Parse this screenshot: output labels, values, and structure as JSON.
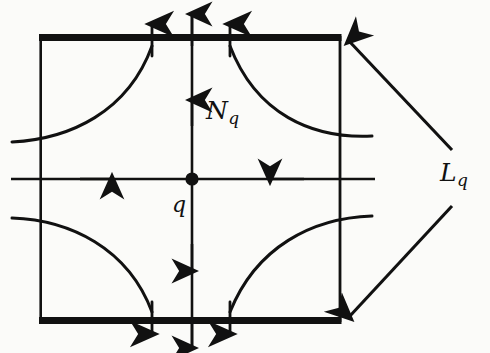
{
  "figure": {
    "background_color": "#fbfbf9",
    "ink_color": "#111111",
    "labels": {
      "unstable_manifold": {
        "base": "N",
        "subscript": "q"
      },
      "stable_manifold": {
        "base": "L",
        "subscript": "q"
      },
      "fixed_point": {
        "base": "q",
        "subscript": ""
      }
    },
    "square": {
      "left": 42,
      "top": 35,
      "right": 340,
      "bottom": 323,
      "bold_edges": [
        "top",
        "bottom"
      ],
      "thin_edges": [
        "left",
        "right"
      ],
      "bold_edge_width": 7,
      "thin_edge_width": 2.6
    },
    "fixed_point": {
      "x": 192,
      "y": 179,
      "radius": 6.5
    },
    "axes": {
      "vertical": {
        "x": 192,
        "from_y": 8,
        "to_y": 350,
        "arrows": [
          {
            "y": 104,
            "direction": "up"
          },
          {
            "y": 27,
            "direction": "up"
          },
          {
            "y": 268,
            "direction": "down"
          },
          {
            "y": 345,
            "direction": "down"
          }
        ]
      },
      "horizontal": {
        "y": 179,
        "from_x": 10,
        "to_x": 376,
        "arrows": [
          {
            "x": 110,
            "direction": "right"
          },
          {
            "x": 272,
            "direction": "left"
          }
        ]
      }
    },
    "curves": [
      {
        "quadrant": "top-left",
        "enters_edge": "left",
        "exit_edge": "top",
        "exit_x": 155,
        "arrow": "up"
      },
      {
        "quadrant": "top-right",
        "enters_edge": "right",
        "exit_edge": "top",
        "exit_x": 228,
        "arrow": "up"
      },
      {
        "quadrant": "bottom-left",
        "enters_edge": "left",
        "exit_edge": "bottom",
        "exit_x": 155,
        "arrow": "down"
      },
      {
        "quadrant": "bottom-right",
        "enters_edge": "right",
        "exit_edge": "bottom",
        "exit_x": 228,
        "arrow": "down"
      }
    ],
    "leaders": [
      {
        "name": "upper",
        "from_x": 452,
        "from_y": 150,
        "to_x": 348,
        "to_y": 40,
        "arrow_at": "end"
      },
      {
        "name": "lower",
        "from_x": 452,
        "from_y": 206,
        "to_x": 348,
        "to_y": 318,
        "arrow_at": "end"
      }
    ]
  }
}
